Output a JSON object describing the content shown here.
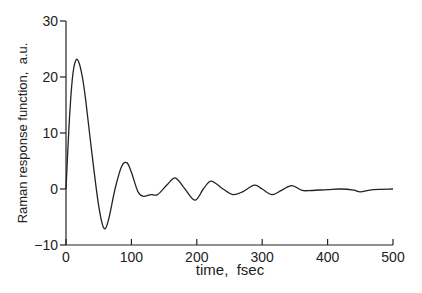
{
  "chart_data": {
    "type": "line",
    "title": "",
    "xlabel": "time,  fsec",
    "ylabel": "Raman response function,  a.u.",
    "xlim": [
      0,
      500
    ],
    "ylim": [
      -10,
      30
    ],
    "xticks": [
      "0",
      "100",
      "200",
      "300",
      "400",
      "500"
    ],
    "yticks": [
      "-10",
      "0",
      "10",
      "20",
      "30"
    ],
    "grid": false,
    "legend": null,
    "series": [
      {
        "name": "Raman response",
        "x": [
          0,
          5,
          10,
          15,
          20,
          25,
          30,
          40,
          50,
          58,
          65,
          75,
          85,
          93,
          100,
          110,
          118,
          130,
          140,
          155,
          167,
          180,
          197,
          210,
          222,
          240,
          255,
          270,
          288,
          300,
          315,
          330,
          345,
          360,
          370,
          400,
          420,
          440,
          450,
          470,
          500
        ],
        "y": [
          0,
          12,
          20,
          23,
          22.5,
          20,
          16,
          6,
          -3,
          -7,
          -5.5,
          0,
          4,
          4.7,
          3,
          -0.5,
          -1.3,
          -1,
          -1,
          0.8,
          2,
          0.3,
          -2,
          0,
          1.4,
          0,
          -1,
          -0.5,
          0.7,
          0,
          -1,
          -0.2,
          0.6,
          -0.2,
          -0.3,
          -0.1,
          0,
          -0.2,
          -0.5,
          -0.1,
          0
        ]
      }
    ]
  }
}
